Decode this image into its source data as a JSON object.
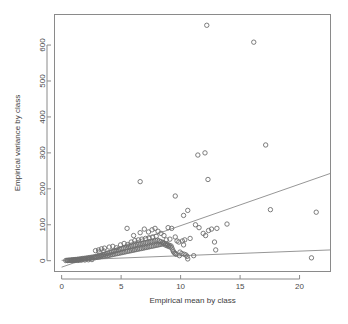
{
  "chart_data": {
    "type": "scatter",
    "title": "",
    "xlabel": "Empirical mean by class",
    "ylabel": "Empirical variance by class",
    "xlim": [
      -0.6,
      22.6
    ],
    "ylim": [
      -30,
      685
    ],
    "xticks": [
      0,
      5,
      10,
      15,
      20
    ],
    "yticks": [
      0,
      100,
      200,
      300,
      400,
      500,
      600
    ],
    "xtick_labels": [
      "0",
      "5",
      "10",
      "15",
      "20"
    ],
    "ytick_labels": [
      "0",
      "100",
      "200",
      "300",
      "400",
      "500",
      "600"
    ],
    "grid": false,
    "legend": null,
    "marker": "open-circle",
    "point_count": 206,
    "points": [
      [
        0.35,
        0.5
      ],
      [
        0.45,
        1.2
      ],
      [
        0.55,
        0.8
      ],
      [
        0.62,
        1.6
      ],
      [
        0.7,
        1.0
      ],
      [
        0.78,
        2.0
      ],
      [
        0.85,
        1.4
      ],
      [
        0.92,
        2.4
      ],
      [
        1.0,
        1.8
      ],
      [
        1.05,
        3.0
      ],
      [
        1.12,
        2.2
      ],
      [
        1.2,
        3.4
      ],
      [
        1.26,
        2.6
      ],
      [
        1.33,
        4.0
      ],
      [
        1.4,
        3.0
      ],
      [
        1.48,
        4.6
      ],
      [
        1.55,
        3.4
      ],
      [
        1.62,
        5.2
      ],
      [
        1.7,
        4.0
      ],
      [
        1.76,
        6.0
      ],
      [
        1.84,
        4.4
      ],
      [
        1.9,
        6.6
      ],
      [
        1.98,
        5.0
      ],
      [
        2.05,
        7.2
      ],
      [
        2.12,
        5.6
      ],
      [
        2.2,
        8.0
      ],
      [
        2.26,
        6.2
      ],
      [
        2.34,
        8.6
      ],
      [
        2.4,
        6.8
      ],
      [
        2.48,
        9.4
      ],
      [
        2.55,
        7.4
      ],
      [
        2.62,
        10.0
      ],
      [
        2.7,
        8.0
      ],
      [
        2.77,
        11.0
      ],
      [
        2.84,
        8.6
      ],
      [
        2.9,
        12.0
      ],
      [
        2.98,
        9.4
      ],
      [
        3.05,
        13.0
      ],
      [
        3.12,
        10.0
      ],
      [
        3.2,
        14.0
      ],
      [
        3.26,
        11.0
      ],
      [
        3.34,
        15.0
      ],
      [
        3.4,
        11.6
      ],
      [
        3.48,
        16.5
      ],
      [
        3.55,
        12.4
      ],
      [
        3.62,
        18.0
      ],
      [
        3.7,
        13.0
      ],
      [
        3.76,
        19.5
      ],
      [
        3.84,
        14.0
      ],
      [
        3.9,
        21.0
      ],
      [
        3.98,
        15.0
      ],
      [
        4.05,
        22.5
      ],
      [
        4.12,
        16.0
      ],
      [
        4.2,
        24.0
      ],
      [
        4.26,
        17.0
      ],
      [
        4.34,
        25.5
      ],
      [
        4.4,
        18.0
      ],
      [
        4.48,
        27.0
      ],
      [
        4.55,
        19.0
      ],
      [
        4.62,
        28.5
      ],
      [
        4.7,
        20.0
      ],
      [
        4.77,
        30.0
      ],
      [
        4.84,
        21.0
      ],
      [
        4.9,
        31.5
      ],
      [
        4.98,
        22.0
      ],
      [
        5.05,
        33.0
      ],
      [
        5.12,
        23.0
      ],
      [
        5.2,
        34.5
      ],
      [
        5.26,
        24.0
      ],
      [
        5.34,
        36.0
      ],
      [
        5.4,
        25.0
      ],
      [
        5.48,
        37.0
      ],
      [
        5.55,
        26.0
      ],
      [
        5.62,
        38.5
      ],
      [
        5.7,
        27.0
      ],
      [
        5.77,
        40.0
      ],
      [
        5.84,
        28.0
      ],
      [
        5.9,
        41.0
      ],
      [
        5.98,
        29.0
      ],
      [
        6.05,
        42.5
      ],
      [
        6.12,
        30.0
      ],
      [
        6.2,
        43.5
      ],
      [
        6.26,
        31.0
      ],
      [
        6.34,
        45.0
      ],
      [
        6.4,
        32.0
      ],
      [
        6.48,
        46.0
      ],
      [
        6.55,
        33.0
      ],
      [
        6.62,
        47.0
      ],
      [
        6.7,
        34.0
      ],
      [
        6.77,
        48.0
      ],
      [
        6.84,
        35.0
      ],
      [
        6.9,
        49.0
      ],
      [
        6.98,
        36.0
      ],
      [
        7.05,
        50.0
      ],
      [
        7.12,
        37.0
      ],
      [
        7.2,
        51.0
      ],
      [
        7.26,
        38.0
      ],
      [
        7.34,
        52.0
      ],
      [
        7.4,
        39.0
      ],
      [
        7.48,
        53.0
      ],
      [
        7.55,
        40.0
      ],
      [
        7.62,
        54.0
      ],
      [
        7.7,
        41.0
      ],
      [
        7.77,
        55.0
      ],
      [
        7.84,
        42.0
      ],
      [
        7.9,
        56.0
      ],
      [
        7.98,
        43.0
      ],
      [
        8.05,
        57.0
      ],
      [
        8.12,
        44.0
      ],
      [
        8.2,
        55.0
      ],
      [
        8.26,
        45.0
      ],
      [
        8.34,
        53.0
      ],
      [
        8.4,
        46.0
      ],
      [
        8.48,
        51.0
      ],
      [
        8.55,
        47.0
      ],
      [
        8.62,
        49.0
      ],
      [
        8.7,
        44.0
      ],
      [
        8.77,
        47.0
      ],
      [
        8.84,
        42.0
      ],
      [
        8.9,
        45.0
      ],
      [
        8.98,
        40.0
      ],
      [
        9.05,
        43.0
      ],
      [
        9.12,
        38.0
      ],
      [
        9.2,
        41.0
      ],
      [
        9.26,
        36.0
      ],
      [
        9.34,
        30.0
      ],
      [
        9.4,
        25.0
      ],
      [
        9.48,
        22.0
      ],
      [
        9.55,
        20.0
      ],
      [
        9.62,
        18.0
      ],
      [
        2.85,
        28.0
      ],
      [
        3.1,
        30.0
      ],
      [
        3.35,
        33.0
      ],
      [
        3.6,
        35.0
      ],
      [
        3.15,
        24.0
      ],
      [
        3.55,
        27.0
      ],
      [
        4.0,
        38.0
      ],
      [
        4.3,
        40.0
      ],
      [
        4.6,
        36.0
      ],
      [
        4.95,
        44.0
      ],
      [
        5.25,
        48.0
      ],
      [
        5.55,
        45.0
      ],
      [
        5.85,
        52.0
      ],
      [
        6.15,
        56.0
      ],
      [
        6.45,
        58.0
      ],
      [
        6.75,
        60.0
      ],
      [
        7.05,
        62.0
      ],
      [
        7.35,
        64.0
      ],
      [
        7.65,
        66.0
      ],
      [
        7.95,
        68.0
      ],
      [
        5.5,
        90.0
      ],
      [
        6.05,
        70.0
      ],
      [
        6.6,
        78.0
      ],
      [
        6.95,
        88.0
      ],
      [
        7.3,
        80.0
      ],
      [
        7.6,
        86.0
      ],
      [
        7.85,
        90.0
      ],
      [
        8.1,
        82.0
      ],
      [
        8.35,
        76.0
      ],
      [
        8.6,
        70.0
      ],
      [
        8.95,
        92.0
      ],
      [
        9.25,
        90.0
      ],
      [
        9.55,
        66.0
      ],
      [
        9.1,
        60.0
      ],
      [
        8.8,
        58.0
      ],
      [
        9.7,
        55.0
      ],
      [
        9.85,
        52.0
      ],
      [
        9.95,
        24.0
      ],
      [
        10.1,
        20.0
      ],
      [
        10.3,
        18.0
      ],
      [
        10.45,
        16.0
      ],
      [
        9.9,
        14.0
      ],
      [
        10.55,
        12.0
      ],
      [
        10.15,
        55.0
      ],
      [
        10.35,
        58.0
      ],
      [
        10.25,
        44.0
      ],
      [
        10.6,
        5.0
      ],
      [
        11.1,
        14.0
      ],
      [
        10.8,
        62.0
      ],
      [
        11.25,
        100.0
      ],
      [
        11.55,
        92.0
      ],
      [
        11.9,
        76.0
      ],
      [
        12.1,
        70.0
      ],
      [
        12.35,
        84.0
      ],
      [
        12.6,
        88.0
      ],
      [
        12.85,
        52.0
      ],
      [
        12.95,
        30.0
      ],
      [
        13.05,
        90.0
      ],
      [
        13.9,
        102.0
      ],
      [
        6.6,
        220.0
      ],
      [
        9.55,
        180.0
      ],
      [
        10.25,
        126.0
      ],
      [
        10.6,
        140.0
      ],
      [
        11.45,
        294.0
      ],
      [
        12.05,
        300.0
      ],
      [
        12.3,
        226.0
      ],
      [
        12.2,
        655.0
      ],
      [
        16.15,
        608.0
      ],
      [
        17.15,
        322.0
      ],
      [
        17.55,
        142.0
      ],
      [
        21.4,
        135.0
      ],
      [
        21.0,
        8.0
      ],
      [
        1.05,
        0.6
      ],
      [
        1.35,
        1.0
      ],
      [
        1.65,
        1.5
      ],
      [
        1.95,
        2.0
      ],
      [
        2.25,
        2.6
      ],
      [
        2.55,
        3.2
      ],
      [
        0.5,
        0.3
      ],
      [
        0.8,
        0.5
      ],
      [
        1.15,
        0.9
      ],
      [
        1.45,
        1.3
      ]
    ],
    "lines": [
      {
        "name": "steep-fit-line",
        "x0": 0.0,
        "y0": -18.0,
        "x1": 22.6,
        "y1": 243.0,
        "slope": 11.55,
        "intercept": -18.0
      },
      {
        "name": "shallow-fit-line",
        "x0": 0.0,
        "y0": 1.0,
        "x1": 22.6,
        "y1": 30.0,
        "slope": 1.28,
        "intercept": 1.0
      }
    ]
  },
  "plot": {
    "background_color": "#ffffff",
    "frame_color": "#8a8a8a",
    "point_color": "#6e6e6e",
    "line_color": "#8a8a8a",
    "text_color": "#3d3d3d"
  }
}
